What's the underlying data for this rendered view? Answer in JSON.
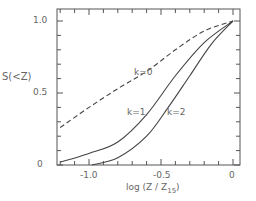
{
  "chart_data": {
    "type": "line",
    "title": "",
    "xlabel": "log (Z / Z15)",
    "ylabel": "S(<Z)",
    "xlim": [
      -1.22,
      0.05
    ],
    "ylim": [
      0,
      1.05
    ],
    "xticks": [
      "-1.0",
      "-0.5",
      "0"
    ],
    "yticks": [
      "0",
      "0.5",
      "1.0"
    ],
    "grid": false,
    "legend": "inline labels",
    "series": [
      {
        "name": "k=0",
        "style": "dashed",
        "x": [
          -1.2,
          -1.0,
          -0.8,
          -0.6,
          -0.4,
          -0.2,
          0.0
        ],
        "y": [
          0.26,
          0.4,
          0.53,
          0.65,
          0.8,
          0.93,
          1.0
        ]
      },
      {
        "name": "k=1",
        "style": "solid",
        "x": [
          -1.2,
          -1.0,
          -0.8,
          -0.6,
          -0.4,
          -0.2,
          0.0
        ],
        "y": [
          0.02,
          0.08,
          0.16,
          0.35,
          0.62,
          0.85,
          1.0
        ]
      },
      {
        "name": "k=2",
        "style": "solid",
        "x": [
          -0.98,
          -0.8,
          -0.6,
          -0.45,
          -0.3,
          -0.15,
          0.0
        ],
        "y": [
          0.0,
          0.05,
          0.2,
          0.4,
          0.62,
          0.84,
          1.0
        ]
      }
    ],
    "annotations": [
      {
        "text": "k=0",
        "x": -0.62,
        "y": 0.62
      },
      {
        "text": "k=1",
        "x": -0.72,
        "y": 0.34
      },
      {
        "text": "k=2",
        "x": -0.46,
        "y": 0.34
      }
    ]
  },
  "labels": {
    "y_axis": "S(<Z)",
    "x_axis_prefix": "log (Z / Z",
    "x_axis_sub": "15",
    "x_axis_suffix": ")",
    "ytick_0": "0",
    "ytick_05": "0.5",
    "ytick_10": "1.0",
    "xtick_m10": "-1.0",
    "xtick_m05": "-0.5",
    "xtick_0": "0",
    "k0": "k=0",
    "k1": "k=1",
    "k2": "k=2"
  }
}
